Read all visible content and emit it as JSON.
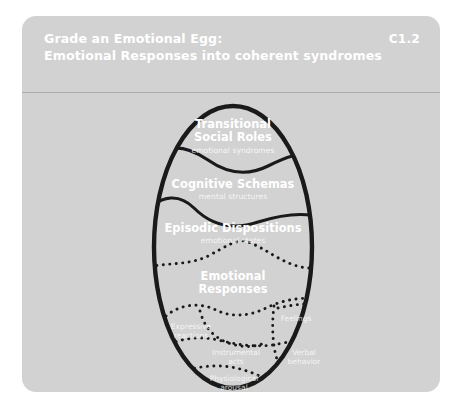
{
  "card": {
    "background_color": "#d2d2d2",
    "text_color": "#ffffff"
  },
  "header": {
    "title_line_1": "Grade an Emotional Egg:",
    "title_line_2": "Emotional Responses into coherent syndromes",
    "code": "C1.2"
  },
  "diagram": {
    "type": "nested-egg-layers",
    "outline_color": "#1a1a1a",
    "layers": [
      {
        "title": "Transitional\nSocial Roles",
        "title_line_1": "Transitional",
        "title_line_2": "Social Roles",
        "subtitle": "emotional syndromes",
        "divider_style": "solid-wave"
      },
      {
        "title_line_1": "Cognitive Schemas",
        "title_line_2": "",
        "subtitle": "mental structures",
        "divider_style": "solid-wave"
      },
      {
        "title_line_1": "Episodic Dispositions",
        "title_line_2": "",
        "subtitle": "emotional states",
        "divider_style": "dotted-wave"
      },
      {
        "title_line_1": "Emotional",
        "title_line_2": "Responses",
        "subtitle": "",
        "divider_style": "dotted-wave"
      }
    ],
    "components": [
      {
        "line_1": "Expressive",
        "line_2": "reactions"
      },
      {
        "line_1": "Feelings",
        "line_2": ""
      },
      {
        "line_1": "Instrumental",
        "line_2": "acts"
      },
      {
        "line_1": "Verbal",
        "line_2": "behavior"
      },
      {
        "line_1": "Physiological",
        "line_2": "arousal"
      }
    ]
  }
}
